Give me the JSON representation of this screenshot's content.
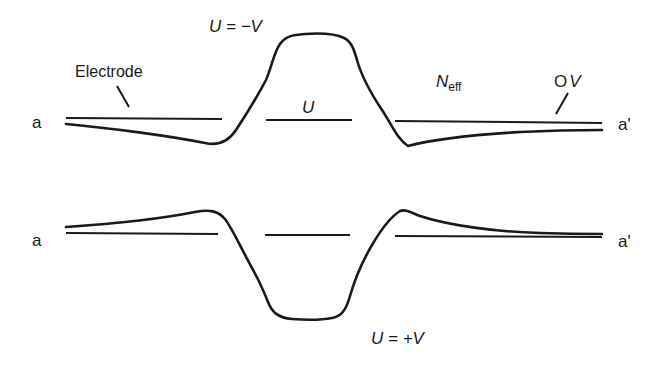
{
  "diagram": {
    "top_panel": {
      "left_end_label": "a",
      "right_end_label": "a'",
      "electrode_label": "Electrode",
      "potential_label": "U = −V",
      "center_label": "U",
      "neff_label_main": "N",
      "neff_label_sub": "eff",
      "zero_volt_label_o": "O",
      "zero_volt_label_v": "V"
    },
    "bottom_panel": {
      "left_end_label": "a",
      "right_end_label": "a'",
      "potential_label": "U = +V"
    },
    "colors": {
      "stroke": "#1a1a1a",
      "background": "#ffffff"
    }
  }
}
